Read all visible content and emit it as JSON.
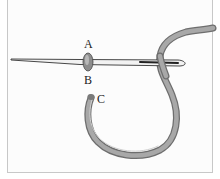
{
  "diagram": {
    "labels": {
      "a": "A",
      "b": "B",
      "c": "C"
    },
    "colors": {
      "thread": "#9a9a9a",
      "thread_dark": "#6e6e6e",
      "needle": "#e8e8e8",
      "outline": "#333333",
      "frame": "#c8c8c8"
    }
  }
}
